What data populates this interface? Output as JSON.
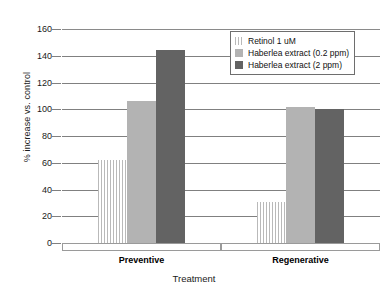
{
  "chart_data": {
    "type": "bar",
    "title": "",
    "xlabel": "Treatment",
    "ylabel": "% increase vs. control",
    "categories": [
      "Preventive",
      "Regenerative"
    ],
    "ylim": [
      0,
      160
    ],
    "yticks": [
      0,
      20,
      40,
      60,
      80,
      100,
      120,
      140,
      160
    ],
    "grid": true,
    "legend_position": "top-right",
    "series": [
      {
        "name": "Retinol 1 uM",
        "swatch": "sw-hatch",
        "color": "#b9b9b9",
        "values": [
          62,
          31
        ]
      },
      {
        "name": "Haberlea extract (0.2 ppm)",
        "swatch": "sw-light",
        "color": "#b3b3b3",
        "values": [
          106,
          102
        ]
      },
      {
        "name": "Haberlea extract (2 ppm)",
        "swatch": "sw-dark",
        "color": "#636363",
        "values": [
          144,
          100
        ]
      }
    ]
  },
  "axis": {
    "y_title": "% increase vs. control",
    "x_title": "Treatment",
    "y_tick_labels": [
      "160",
      "140",
      "120",
      "100",
      "80",
      "60",
      "40",
      "20",
      "0"
    ]
  },
  "categories": {
    "0": {
      "label": "Preventive"
    },
    "1": {
      "label": "Regenerative"
    }
  },
  "legend": {
    "items": [
      {
        "label": "Retinol 1 uM"
      },
      {
        "label": "Haberlea extract (0.2 ppm)"
      },
      {
        "label": "Haberlea extract (2 ppm)"
      }
    ]
  }
}
